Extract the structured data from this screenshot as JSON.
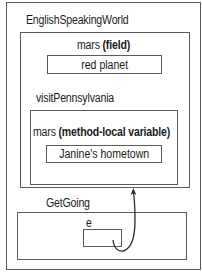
{
  "diagram": {
    "outer_class": {
      "title": "EnglishSpeakingWorld",
      "field": {
        "name": "mars",
        "kind": "(field)",
        "value": "red planet"
      },
      "method": {
        "name": "visitPennsylvania",
        "local_var": {
          "name": "mars",
          "kind": "(method-local variable)",
          "value": "Janine's hometown"
        }
      }
    },
    "caller": {
      "title": "GetGoing",
      "variable": {
        "name": "e",
        "value": ""
      }
    },
    "arrow": {
      "from": "GetGoing.e",
      "to": "EnglishSpeakingWorld"
    },
    "colors": {
      "border": "#5a5a5a",
      "text": "#1a1a1a",
      "background": "#ffffff"
    }
  }
}
